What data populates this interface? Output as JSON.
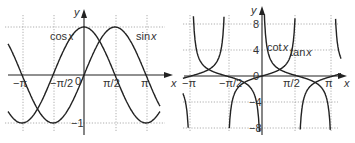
{
  "chart_data": [
    {
      "type": "line",
      "title": "",
      "xlabel": "x",
      "ylabel": "y",
      "xlim": [
        -3.3,
        3.6
      ],
      "ylim": [
        -1.1,
        1.3
      ],
      "grid": true,
      "x_ticks": [
        "-π",
        "-π/2",
        "0",
        "π/2",
        "π"
      ],
      "y_ticks": [
        "1",
        "-1"
      ],
      "series": [
        {
          "name": "cos x",
          "label": "cos x",
          "function": "cos(x)",
          "x_range": [
            -3.6,
            3.6
          ]
        },
        {
          "name": "sin x",
          "label": "sin x",
          "function": "sin(x)",
          "x_range": [
            -3.6,
            3.6
          ]
        }
      ],
      "annotations": [
        "cos x",
        "sin x"
      ]
    },
    {
      "type": "line",
      "title": "",
      "xlabel": "x",
      "ylabel": "y",
      "xlim": [
        -3.4,
        3.4
      ],
      "ylim": [
        -8.5,
        9
      ],
      "grid": true,
      "x_ticks": [
        "-π",
        "-π/2",
        "0",
        "π/2",
        "π"
      ],
      "y_ticks": [
        "8",
        "4",
        "0",
        "-4",
        "-8"
      ],
      "series": [
        {
          "name": "cot x",
          "label": "cot x",
          "function": "cot(x)"
        },
        {
          "name": "tan x",
          "label": "tan x",
          "function": "tan(x)"
        }
      ],
      "annotations": [
        "cot x",
        "tan x"
      ]
    }
  ],
  "left": {
    "axis_x": "x",
    "axis_y": "y",
    "ticks_x": [
      "−π",
      "−π/2",
      "π/2",
      "π"
    ],
    "origin": "0",
    "tick_y_pos": "1",
    "tick_y_neg": "−1",
    "label_cos": "cos",
    "label_sin": "sin",
    "var": "x"
  },
  "right": {
    "axis_x": "x",
    "axis_y": "y",
    "ticks_x": [
      "−π",
      "−π/2",
      "π/2",
      "π"
    ],
    "origin": "0",
    "ticks_y": [
      "8",
      "4",
      "−4",
      "−8"
    ],
    "label_cot": "cot",
    "label_tan": "tan",
    "var": "x"
  }
}
